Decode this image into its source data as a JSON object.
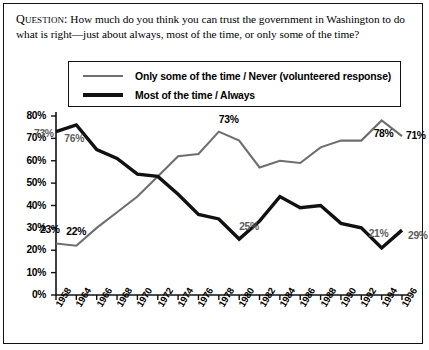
{
  "question": {
    "label": "Question:",
    "text": " How much do you think you can trust the government in Washington to do what is right—just about always, most of the time, or only some of the time?"
  },
  "legend": {
    "position": "top-center",
    "entries": [
      {
        "label": "Only some of the time / Never (volunteered response)",
        "color": "#6e6e6e",
        "style": "thin-gray-line"
      },
      {
        "label": "Most of the time / Always",
        "color": "#111111",
        "style": "thick-black-line"
      }
    ]
  },
  "chart_data": {
    "type": "line",
    "title": "",
    "subtitle": "",
    "xlabel": "",
    "ylabel": "",
    "grid": false,
    "ylim": [
      0,
      80
    ],
    "ytick_labels": [
      "80%",
      "70%",
      "60%",
      "50%",
      "40%",
      "30%",
      "20%",
      "10%",
      "0%"
    ],
    "ytick_values": [
      80,
      70,
      60,
      50,
      40,
      30,
      20,
      10,
      0
    ],
    "categories": [
      "1958",
      "1964",
      "1966",
      "1968",
      "1970",
      "1972",
      "1974",
      "1976",
      "1978",
      "1980",
      "1982",
      "1984",
      "1986",
      "1988",
      "1990",
      "1992",
      "1994",
      "1996"
    ],
    "x": [
      1958,
      1964,
      1966,
      1968,
      1970,
      1972,
      1974,
      1976,
      1978,
      1980,
      1982,
      1984,
      1986,
      1988,
      1990,
      1992,
      1994,
      1996
    ],
    "series": [
      {
        "name": "Only some of the time / Never (volunteered response)",
        "color": "#6e6e6e",
        "values": [
          23,
          22,
          30,
          37,
          44,
          53,
          62,
          63,
          73,
          69,
          57,
          60,
          59,
          66,
          69,
          69,
          78,
          71
        ]
      },
      {
        "name": "Most of the time / Always",
        "color": "#111111",
        "values": [
          73,
          76,
          65,
          61,
          54,
          53,
          45,
          36,
          34,
          25,
          33,
          44,
          39,
          40,
          32,
          30,
          21,
          29
        ]
      }
    ],
    "annotations": [
      {
        "text": "73%",
        "series": "Most of the time / Always",
        "x": 1958,
        "y": 73
      },
      {
        "text": "76%",
        "series": "Most of the time / Always",
        "x": 1964,
        "y": 76
      },
      {
        "text": "25%",
        "series": "Most of the time / Always",
        "x": 1980,
        "y": 25
      },
      {
        "text": "21%",
        "series": "Most of the time / Always",
        "x": 1994,
        "y": 21
      },
      {
        "text": "29%",
        "series": "Most of the time / Always",
        "x": 1996,
        "y": 29
      },
      {
        "text": "23%",
        "series": "Only some of the time / Never (volunteered response)",
        "x": 1958,
        "y": 23
      },
      {
        "text": "22%",
        "series": "Only some of the time / Never (volunteered response)",
        "x": 1964,
        "y": 22
      },
      {
        "text": "73%",
        "series": "Only some of the time / Never (volunteered response)",
        "x": 1978,
        "y": 73
      },
      {
        "text": "78%",
        "series": "Only some of the time / Never (volunteered response)",
        "x": 1994,
        "y": 78
      },
      {
        "text": "71%",
        "series": "Only some of the time / Never (volunteered response)",
        "x": 1996,
        "y": 71
      }
    ]
  }
}
